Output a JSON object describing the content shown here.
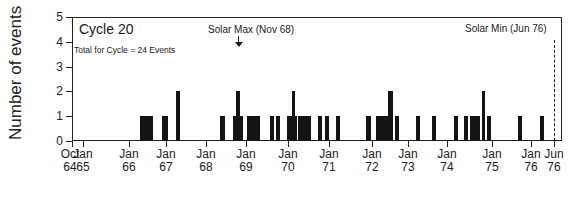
{
  "chart_data": {
    "type": "bar",
    "title": "Cycle 20",
    "subtitle": "Total for Cycle = 24 Events",
    "xlabel": "",
    "ylabel": "Number of events",
    "ylim": [
      0,
      5
    ],
    "yticks": [
      0,
      1,
      2,
      3,
      4,
      5
    ],
    "grid": false,
    "xticks": [
      {
        "line1": "Oct",
        "line2": "64",
        "x": 72
      },
      {
        "line1": "Jan",
        "line2": "65",
        "x": 83
      },
      {
        "line1": "Jan",
        "line2": "66",
        "x": 129
      },
      {
        "line1": "Jan",
        "line2": "67",
        "x": 166
      },
      {
        "line1": "Jan",
        "line2": "68",
        "x": 206
      },
      {
        "line1": "Jan",
        "line2": "69",
        "x": 246
      },
      {
        "line1": "Jan",
        "line2": "70",
        "x": 288
      },
      {
        "line1": "Jan",
        "line2": "71",
        "x": 329
      },
      {
        "line1": "Jan",
        "line2": "72",
        "x": 372
      },
      {
        "line1": "Jan",
        "line2": "73",
        "x": 408
      },
      {
        "line1": "Jan",
        "line2": "74",
        "x": 447
      },
      {
        "line1": "Jan",
        "line2": "75",
        "x": 492
      },
      {
        "line1": "Jan",
        "line2": "76",
        "x": 531
      },
      {
        "line1": "Jun",
        "line2": "76",
        "x": 554
      }
    ],
    "annotations": [
      {
        "text": "Solar Max (Nov 68)",
        "type": "arrow",
        "x": 238
      },
      {
        "text": "Solar Min (Jun 76)",
        "type": "dashed-line",
        "x": 554
      }
    ],
    "bars": [
      {
        "approx_date": "Jun 66",
        "x": 140,
        "w": 6,
        "value": 1
      },
      {
        "approx_date": "Aug 66",
        "x": 146,
        "w": 7,
        "value": 1
      },
      {
        "approx_date": "Dec 66",
        "x": 162,
        "w": 6,
        "value": 1
      },
      {
        "approx_date": "Apr 67",
        "x": 176,
        "w": 4,
        "value": 2
      },
      {
        "approx_date": "May 68",
        "x": 220,
        "w": 5,
        "value": 1
      },
      {
        "approx_date": "Sep 68",
        "x": 233,
        "w": 3,
        "value": 1
      },
      {
        "approx_date": "Oct 68",
        "x": 236,
        "w": 4,
        "value": 2
      },
      {
        "approx_date": "Nov 68",
        "x": 240,
        "w": 3,
        "value": 1
      },
      {
        "approx_date": "Feb 69",
        "x": 247,
        "w": 13,
        "value": 1
      },
      {
        "approx_date": "Jul 69",
        "x": 270,
        "w": 4,
        "value": 1
      },
      {
        "approx_date": "Sep 69",
        "x": 276,
        "w": 4,
        "value": 1
      },
      {
        "approx_date": "Dec 69",
        "x": 287,
        "w": 5,
        "value": 1
      },
      {
        "approx_date": "Jan 70",
        "x": 292,
        "w": 3,
        "value": 2
      },
      {
        "approx_date": "Feb 70",
        "x": 295,
        "w": 2,
        "value": 1
      },
      {
        "approx_date": "Mar 70",
        "x": 298,
        "w": 13,
        "value": 1
      },
      {
        "approx_date": "Aug 70",
        "x": 318,
        "w": 4,
        "value": 1
      },
      {
        "approx_date": "Oct 70",
        "x": 325,
        "w": 4,
        "value": 1
      },
      {
        "approx_date": "Jan 71",
        "x": 336,
        "w": 4,
        "value": 1
      },
      {
        "approx_date": "Nov 71",
        "x": 366,
        "w": 5,
        "value": 1
      },
      {
        "approx_date": "Feb 72",
        "x": 376,
        "w": 12,
        "value": 1
      },
      {
        "approx_date": "Jun 72",
        "x": 388,
        "w": 5,
        "value": 2
      },
      {
        "approx_date": "Aug 72",
        "x": 395,
        "w": 4,
        "value": 1
      },
      {
        "approx_date": "Feb 73",
        "x": 416,
        "w": 4,
        "value": 1
      },
      {
        "approx_date": "Jul 73",
        "x": 432,
        "w": 4,
        "value": 1
      },
      {
        "approx_date": "Feb 74",
        "x": 454,
        "w": 4,
        "value": 1
      },
      {
        "approx_date": "May 74",
        "x": 464,
        "w": 4,
        "value": 1
      },
      {
        "approx_date": "Jul 74",
        "x": 470,
        "w": 10,
        "value": 1
      },
      {
        "approx_date": "Oct 74",
        "x": 482,
        "w": 3,
        "value": 2
      },
      {
        "approx_date": "Nov 74",
        "x": 487,
        "w": 4,
        "value": 1
      },
      {
        "approx_date": "Aug 75",
        "x": 518,
        "w": 4,
        "value": 1
      },
      {
        "approx_date": "Mar 76",
        "x": 540,
        "w": 4,
        "value": 1
      }
    ]
  }
}
